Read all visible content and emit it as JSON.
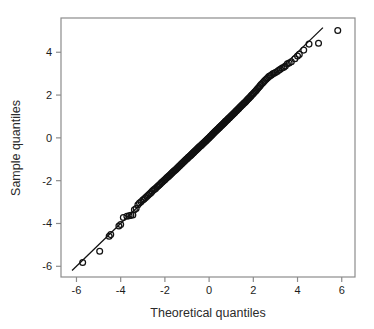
{
  "chart_data": {
    "type": "scatter",
    "title": "",
    "xlabel": "Theoretical quantiles",
    "ylabel": "Sample quantiles",
    "xlim": [
      -6.7,
      6.6
    ],
    "ylim": [
      -6.5,
      5.6
    ],
    "xticks": [
      -6,
      -4,
      -2,
      0,
      2,
      4,
      6
    ],
    "xtick_labels": [
      "-6",
      "-4",
      "-2",
      "0",
      "2",
      "4",
      "6"
    ],
    "yticks": [
      -6,
      -4,
      -2,
      0,
      2,
      4
    ],
    "ytick_labels": [
      "-6",
      "-4",
      "-2",
      "0",
      "2",
      "4"
    ],
    "grid": false,
    "legend": null,
    "marker": "open-circle",
    "marker_color": "#111111",
    "frame_color": "#8c8c8c",
    "reference_line": {
      "label": "qq-reference-line",
      "color": "#111111",
      "x0": -6.2,
      "y0": -6.2,
      "x1": 5.15,
      "y1": 5.15
    },
    "x": [
      -5.72,
      -4.95,
      -4.52,
      -4.45,
      -4.08,
      -4.0,
      -3.88,
      -3.72,
      -3.62,
      -3.54,
      -3.45,
      -3.38,
      -3.3,
      -3.22,
      -3.15,
      -3.08,
      -3.0,
      -2.94,
      -2.88,
      -2.82,
      -2.76,
      -2.7,
      -2.64,
      -2.58,
      -2.52,
      -2.47,
      -2.42,
      -2.36,
      -2.31,
      -2.26,
      -2.21,
      -2.16,
      -2.12,
      -2.07,
      -2.02,
      -1.98,
      -1.93,
      -1.89,
      -1.84,
      -1.8,
      -1.76,
      -1.72,
      -1.68,
      -1.64,
      -1.6,
      -1.56,
      -1.52,
      -1.48,
      -1.44,
      -1.4,
      -1.36,
      -1.33,
      -1.29,
      -1.25,
      -1.22,
      -1.18,
      -1.15,
      -1.11,
      -1.08,
      -1.04,
      -1.01,
      -0.97,
      -0.94,
      -0.91,
      -0.87,
      -0.84,
      -0.81,
      -0.78,
      -0.74,
      -0.71,
      -0.68,
      -0.65,
      -0.62,
      -0.59,
      -0.56,
      -0.53,
      -0.5,
      -0.47,
      -0.44,
      -0.41,
      -0.38,
      -0.35,
      -0.32,
      -0.29,
      -0.26,
      -0.23,
      -0.2,
      -0.17,
      -0.14,
      -0.12,
      -0.09,
      -0.06,
      -0.03,
      0.0,
      0.03,
      0.06,
      0.09,
      0.12,
      0.14,
      0.17,
      0.2,
      0.23,
      0.26,
      0.29,
      0.32,
      0.35,
      0.38,
      0.41,
      0.44,
      0.47,
      0.5,
      0.53,
      0.56,
      0.59,
      0.62,
      0.65,
      0.68,
      0.71,
      0.74,
      0.78,
      0.81,
      0.84,
      0.87,
      0.91,
      0.94,
      0.97,
      1.01,
      1.04,
      1.08,
      1.11,
      1.15,
      1.18,
      1.22,
      1.25,
      1.29,
      1.33,
      1.36,
      1.4,
      1.44,
      1.48,
      1.52,
      1.56,
      1.6,
      1.64,
      1.68,
      1.72,
      1.76,
      1.8,
      1.84,
      1.89,
      1.93,
      1.98,
      2.02,
      2.07,
      2.12,
      2.16,
      2.21,
      2.26,
      2.31,
      2.36,
      2.42,
      2.47,
      2.52,
      2.58,
      2.64,
      2.7,
      2.76,
      2.82,
      2.88,
      2.94,
      3.0,
      3.08,
      3.15,
      3.22,
      3.3,
      3.38,
      3.45,
      3.54,
      3.62,
      3.72,
      3.88,
      4.0,
      4.08,
      4.28,
      4.52,
      4.95,
      5.82
    ],
    "y": [
      -5.82,
      -5.3,
      -4.6,
      -4.52,
      -4.12,
      -4.05,
      -3.72,
      -3.66,
      -3.64,
      -3.62,
      -3.6,
      -3.36,
      -3.3,
      -3.12,
      -3.04,
      -2.98,
      -2.9,
      -2.86,
      -2.8,
      -2.74,
      -2.68,
      -2.62,
      -2.57,
      -2.5,
      -2.44,
      -2.4,
      -2.36,
      -2.3,
      -2.25,
      -2.2,
      -2.16,
      -2.1,
      -2.06,
      -2.02,
      -1.97,
      -1.93,
      -1.88,
      -1.84,
      -1.8,
      -1.76,
      -1.72,
      -1.68,
      -1.64,
      -1.6,
      -1.56,
      -1.52,
      -1.49,
      -1.45,
      -1.41,
      -1.37,
      -1.33,
      -1.3,
      -1.26,
      -1.22,
      -1.19,
      -1.15,
      -1.12,
      -1.08,
      -1.05,
      -1.01,
      -0.98,
      -0.95,
      -0.91,
      -0.88,
      -0.85,
      -0.82,
      -0.79,
      -0.76,
      -0.72,
      -0.69,
      -0.66,
      -0.63,
      -0.6,
      -0.57,
      -0.54,
      -0.51,
      -0.48,
      -0.45,
      -0.42,
      -0.39,
      -0.37,
      -0.34,
      -0.31,
      -0.28,
      -0.25,
      -0.22,
      -0.19,
      -0.16,
      -0.13,
      -0.11,
      -0.08,
      -0.05,
      -0.02,
      0.01,
      0.04,
      0.07,
      0.1,
      0.13,
      0.16,
      0.19,
      0.22,
      0.25,
      0.28,
      0.31,
      0.34,
      0.37,
      0.4,
      0.43,
      0.46,
      0.49,
      0.52,
      0.55,
      0.58,
      0.61,
      0.64,
      0.67,
      0.7,
      0.73,
      0.77,
      0.8,
      0.83,
      0.86,
      0.9,
      0.93,
      0.96,
      1.0,
      1.03,
      1.07,
      1.1,
      1.14,
      1.17,
      1.21,
      1.25,
      1.28,
      1.32,
      1.36,
      1.4,
      1.44,
      1.48,
      1.52,
      1.56,
      1.6,
      1.64,
      1.68,
      1.72,
      1.77,
      1.81,
      1.85,
      1.9,
      1.95,
      2.0,
      2.05,
      2.1,
      2.15,
      2.2,
      2.26,
      2.32,
      2.38,
      2.44,
      2.5,
      2.56,
      2.62,
      2.68,
      2.74,
      2.8,
      2.86,
      2.9,
      2.94,
      3.0,
      3.02,
      3.05,
      3.1,
      3.16,
      3.2,
      3.26,
      3.3,
      3.36,
      3.46,
      3.5,
      3.56,
      3.7,
      3.82,
      3.9,
      4.1,
      4.38,
      4.42,
      5.02
    ]
  }
}
